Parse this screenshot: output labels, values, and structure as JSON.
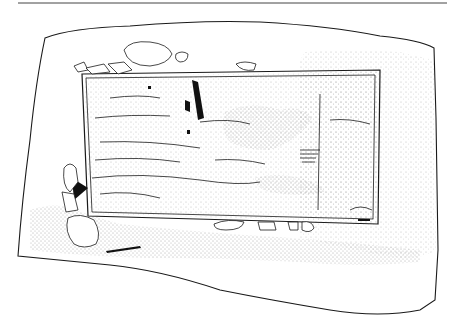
{
  "figure": {
    "type": "archaeological-plan-drawing",
    "labels": [],
    "colors": {
      "background": "#ffffff",
      "line": "#1a1a1a",
      "stipple": "#555555",
      "top_rule": "#444444"
    },
    "elements": [
      "top-rule",
      "excavation-outline",
      "rectangular-grave-cut",
      "stippled-fill",
      "stones-top",
      "stones-bottom",
      "stones-left",
      "black-objects"
    ]
  }
}
